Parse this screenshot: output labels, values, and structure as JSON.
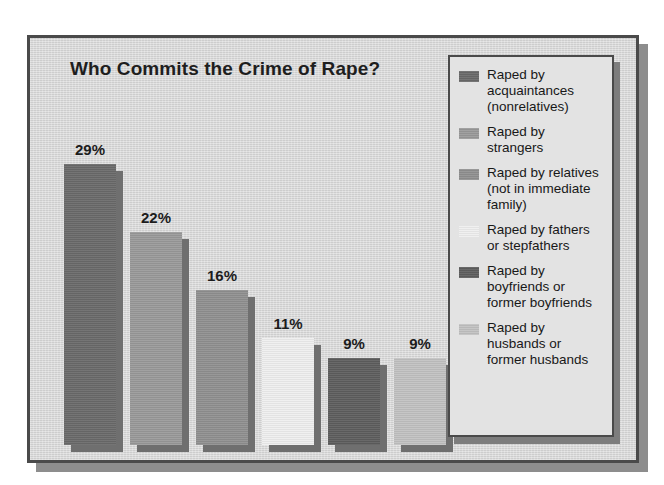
{
  "chart_data": {
    "type": "bar",
    "title": "Who Commits the Crime of Rape?",
    "xlabel": "",
    "ylabel": "",
    "ylim": [
      0,
      32
    ],
    "grid": false,
    "legend_position": "right",
    "categories": [
      "Raped by acquaintances (nonrelatives)",
      "Raped by strangers",
      "Raped by relatives (not in immediate family)",
      "Raped by fathers or stepfathers",
      "Raped by boyfriends or former boyfriends",
      "Raped by husbands or former husbands"
    ],
    "values": [
      29,
      22,
      16,
      11,
      9,
      9
    ],
    "value_labels": [
      "29%",
      "22%",
      "16%",
      "11%",
      "9%",
      "9%"
    ],
    "colors": [
      "#6a6a6a",
      "#9a9a9a",
      "#909090",
      "#efefef",
      "#5e5e5e",
      "#c2c2c2"
    ]
  },
  "legend": {
    "items": [
      {
        "label": "Raped by acquaintances (nonrelatives)",
        "color": "#6a6a6a"
      },
      {
        "label": "Raped by strangers",
        "color": "#9a9a9a"
      },
      {
        "label": "Raped by relatives (not in immediate family)",
        "color": "#909090"
      },
      {
        "label": "Raped by fathers or stepfathers",
        "color": "#efefef"
      },
      {
        "label": "Raped by boyfriends or former boyfriends",
        "color": "#5e5e5e"
      },
      {
        "label": "Raped by husbands or former husbands",
        "color": "#c2c2c2"
      }
    ]
  },
  "figure": {
    "background": "#d6d6d6",
    "frame_color": "#4a4a4a",
    "shadow_color": "#8d8d8d"
  }
}
